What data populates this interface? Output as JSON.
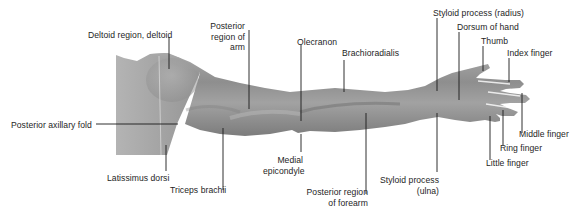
{
  "figure": {
    "colors": {
      "skin_mid": "#9a9a9a",
      "skin_dark": "#6f6f6f",
      "skin_light": "#bdbdbd",
      "leader": "#1a1a1a",
      "text": "#1e1e1e"
    },
    "labels": [
      {
        "id": "deltoid",
        "text": "Deltoid region, deltoid"
      },
      {
        "id": "posterior-axillary-fold",
        "text": "Posterior axillary fold"
      },
      {
        "id": "latissimus-dorsi",
        "text": "Latissimus dorsi"
      },
      {
        "id": "triceps-brachii",
        "text": "Triceps brachii"
      },
      {
        "id": "posterior-region-arm",
        "lines": [
          "Posterior",
          "region of",
          "arm"
        ]
      },
      {
        "id": "olecranon",
        "text": "Olecranon"
      },
      {
        "id": "medial-epicondyle",
        "lines": [
          "Medial",
          "epicondyle"
        ]
      },
      {
        "id": "brachioradialis",
        "text": "Brachioradialis"
      },
      {
        "id": "posterior-region-forearm",
        "lines": [
          "Posterior region",
          "of forearm"
        ]
      },
      {
        "id": "styloid-radius",
        "text": "Styloid process (radius)"
      },
      {
        "id": "styloid-ulna",
        "lines": [
          "Styloid process",
          "(ulna)"
        ]
      },
      {
        "id": "dorsum-of-hand",
        "text": "Dorsum of hand"
      },
      {
        "id": "thumb",
        "text": "Thumb"
      },
      {
        "id": "index-finger",
        "text": "Index finger"
      },
      {
        "id": "middle-finger",
        "text": "Middle finger"
      },
      {
        "id": "ring-finger",
        "text": "Ring finger"
      },
      {
        "id": "little-finger",
        "text": "Little finger"
      }
    ]
  }
}
